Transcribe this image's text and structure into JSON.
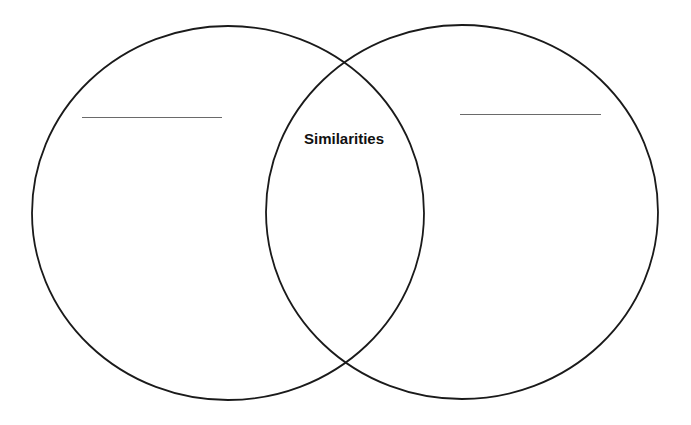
{
  "diagram": {
    "type": "venn",
    "stroke_color": "#1a1a1a",
    "background_color": "#ffffff",
    "circles": [
      {
        "id": "left",
        "cx": 228,
        "cy": 213,
        "rx": 196,
        "ry": 187
      },
      {
        "id": "right",
        "cx": 462,
        "cy": 212,
        "rx": 196,
        "ry": 187
      }
    ],
    "overlap_label": "Similarities",
    "left_title_blank": "",
    "right_title_blank": ""
  }
}
